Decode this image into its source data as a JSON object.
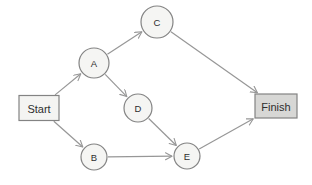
{
  "diagram": {
    "width": 312,
    "height": 185,
    "background_color": "#ffffff",
    "edge_color": "#979797",
    "node_border_color": "#838383",
    "text_color": "#2e2e2e",
    "nodes": [
      {
        "id": "start",
        "label": "Start",
        "shape": "rect",
        "x": 39,
        "y": 108,
        "w": 40,
        "h": 25,
        "fill": "#f4f4f2",
        "font_size": 11
      },
      {
        "id": "A",
        "label": "A",
        "shape": "circle",
        "x": 94,
        "y": 63,
        "r": 15,
        "fill": "#f5f5f3",
        "font_size": 9.5
      },
      {
        "id": "B",
        "label": "B",
        "shape": "circle",
        "x": 94,
        "y": 157,
        "r": 13,
        "fill": "#f5f5f3",
        "font_size": 9.5
      },
      {
        "id": "C",
        "label": "C",
        "shape": "circle",
        "x": 157,
        "y": 22,
        "r": 16,
        "fill": "#f5f5f3",
        "font_size": 9.5
      },
      {
        "id": "D",
        "label": "D",
        "shape": "circle",
        "x": 138,
        "y": 108,
        "r": 14,
        "fill": "#f5f5f3",
        "font_size": 9.5
      },
      {
        "id": "E",
        "label": "E",
        "shape": "circle",
        "x": 187,
        "y": 156,
        "r": 13,
        "fill": "#f5f5f3",
        "font_size": 9.5
      },
      {
        "id": "finish",
        "label": "Finish",
        "shape": "rect",
        "x": 276,
        "y": 106,
        "w": 42,
        "h": 24,
        "fill": "#d7d7d5",
        "font_size": 11
      }
    ],
    "edges": [
      {
        "from": "start",
        "to": "A"
      },
      {
        "from": "start",
        "to": "B"
      },
      {
        "from": "A",
        "to": "C"
      },
      {
        "from": "A",
        "to": "D"
      },
      {
        "from": "B",
        "to": "E"
      },
      {
        "from": "D",
        "to": "E"
      },
      {
        "from": "C",
        "to": "finish"
      },
      {
        "from": "E",
        "to": "finish"
      }
    ]
  }
}
